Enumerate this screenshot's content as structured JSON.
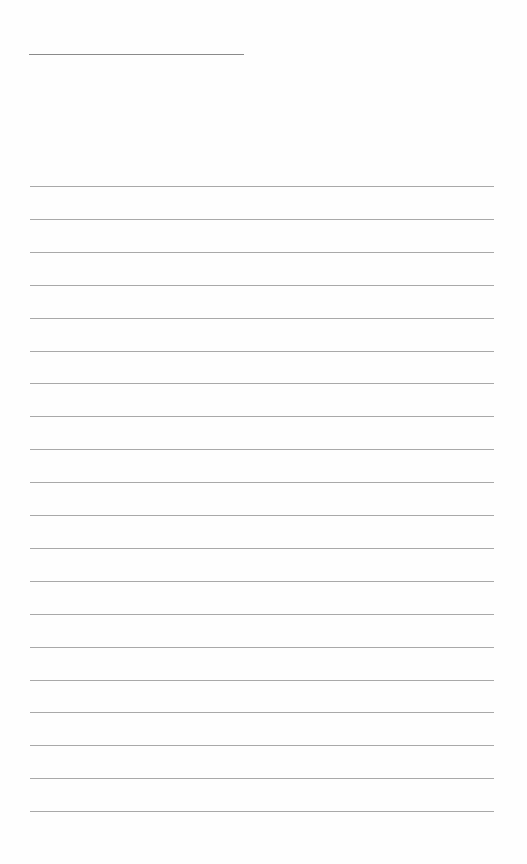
{
  "page": {
    "type": "blank lined writing sheet",
    "header_line": {
      "y": 54,
      "x_start": 29,
      "x_end": 244
    },
    "rules": {
      "count": 20,
      "first_y": 186,
      "spacing": 32.9,
      "x_start": 30,
      "x_end": 494
    },
    "colors": {
      "background": "#fefefe",
      "header_line": "#8a8a8a",
      "rule": "#a9a9a9"
    }
  }
}
